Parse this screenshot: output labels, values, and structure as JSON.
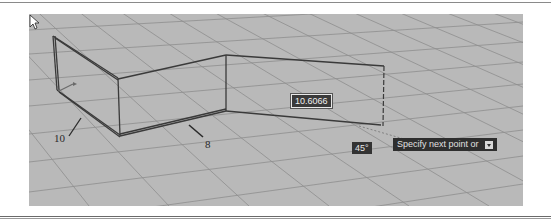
{
  "viewport": {
    "background_color": "#b9b9b9",
    "grid_color": "#8e8e8e",
    "model_line_color": "#3a3a3a"
  },
  "dimensions": {
    "left_width": "10",
    "front_length": "8"
  },
  "dynamic_input": {
    "distance_value": "10.6066",
    "angle_value": "45°"
  },
  "command_prompt": {
    "text": "Specify next point or",
    "icon": "down-arrow-icon"
  },
  "cursor": {
    "icon": "arrow-pointer-icon"
  }
}
